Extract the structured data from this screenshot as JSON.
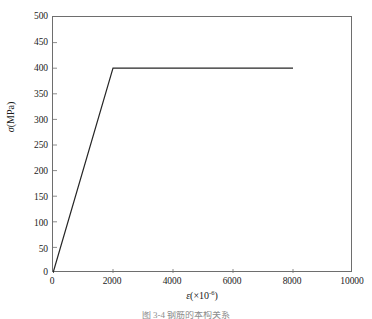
{
  "chart_data": {
    "type": "line",
    "title": "",
    "xlabel": "ε(×10⁻⁶)",
    "xlabel_symbol": "ε",
    "xlabel_paren_open": "(×10",
    "xlabel_exponent": "-6",
    "xlabel_paren_close": ")",
    "ylabel": "σ(MPa)",
    "ylabel_symbol": "σ",
    "ylabel_unit": "(MPa)",
    "xlim": [
      0,
      10000
    ],
    "ylim": [
      0,
      500
    ],
    "xticks": [
      0,
      2000,
      4000,
      6000,
      8000,
      10000
    ],
    "yticks": [
      0,
      50,
      100,
      150,
      200,
      250,
      300,
      350,
      400,
      450,
      500
    ],
    "xtick_labels": [
      "0",
      "2000",
      "4000",
      "6000",
      "8000",
      "10000"
    ],
    "ytick_labels": [
      "0",
      "50",
      "100",
      "150",
      "200",
      "250",
      "300",
      "350",
      "400",
      "450",
      "500"
    ],
    "grid": false,
    "legend": false,
    "legend_position": "none",
    "series": [
      {
        "name": "stress-strain",
        "x": [
          0,
          2000,
          8000
        ],
        "y": [
          0,
          400,
          400
        ],
        "color": "#262626",
        "line_width": 1.2,
        "markers": false
      }
    ],
    "annotations": {
      "yield_strain": 2000,
      "yield_stress": 400,
      "end_strain": 8000,
      "end_stress": 400,
      "description": "Elastic-perfectly-plastic stress-strain relationship"
    }
  },
  "axes": {
    "frame_color": "#6e6e6e",
    "tick_color": "#6e6e6e",
    "background": "#ffffff"
  },
  "caption": {
    "text": "图 3-4   钢筋的本构关系"
  }
}
